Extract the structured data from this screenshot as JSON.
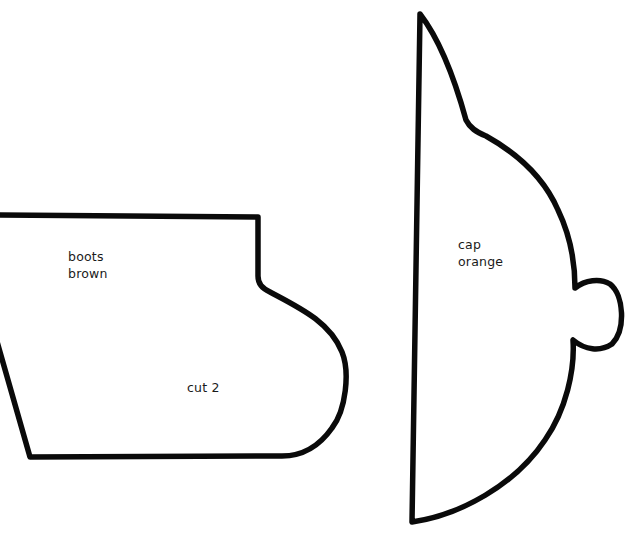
{
  "template": {
    "pieces": [
      {
        "id": "boots",
        "name": "boots",
        "color": "brown",
        "note": "cut 2"
      },
      {
        "id": "cap",
        "name": "cap",
        "color": "orange"
      }
    ]
  },
  "style": {
    "outline_color": "#0a0a0a",
    "background": "#ffffff"
  }
}
